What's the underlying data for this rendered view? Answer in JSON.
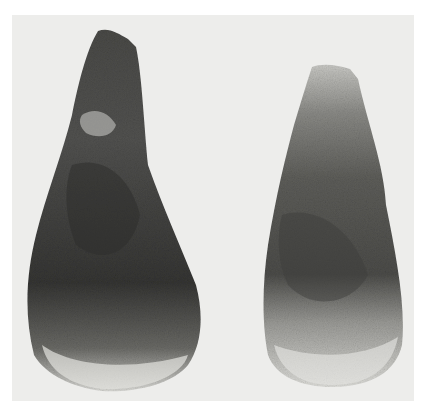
{
  "image": {
    "description": "Photograph of two stone hand axes on a light grey background",
    "objects": [
      {
        "name": "left-hand-axe",
        "tone": "dark"
      },
      {
        "name": "right-hand-axe",
        "tone": "medium-dark with pale tip and base"
      }
    ],
    "colors": {
      "page": "#ffffff",
      "background": "#ededeb",
      "stone_dark": "#3c3c3a",
      "stone_mid": "#5a5a57",
      "stone_light": "#cfcfcb"
    }
  }
}
